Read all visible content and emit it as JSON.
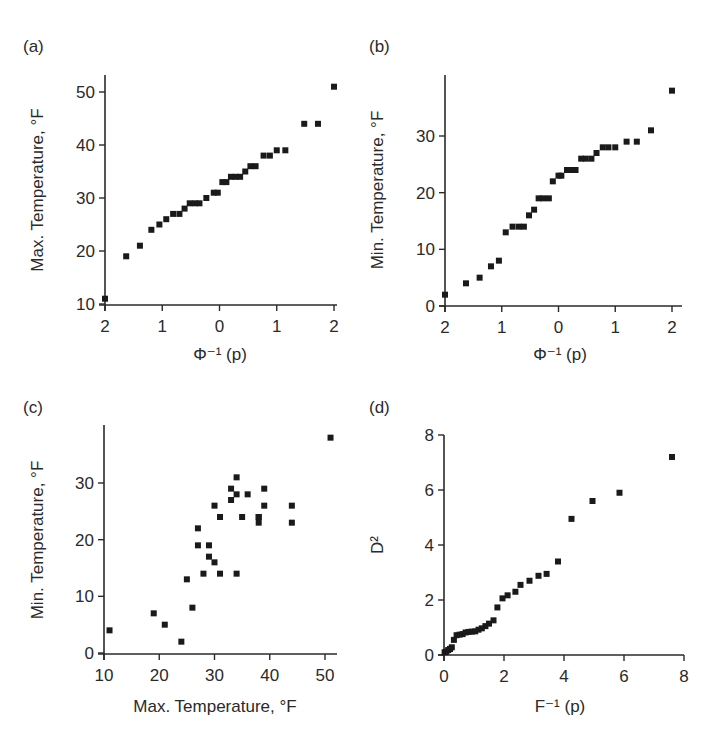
{
  "figure": {
    "panels": [
      {
        "id": "a",
        "label": "(a)"
      },
      {
        "id": "b",
        "label": "(b)"
      },
      {
        "id": "c",
        "label": "(c)"
      },
      {
        "id": "d",
        "label": "(d)"
      }
    ],
    "marker_color": "#1a1a1a",
    "axis_color": "#2a2a2a"
  },
  "chart_data": [
    {
      "panel": "(a)",
      "type": "scatter",
      "title": "",
      "xlabel": "Φ⁻¹ (p)",
      "ylabel": "Max. Temperature, °F",
      "xlim": [
        -2,
        2
      ],
      "ylim": [
        10,
        52
      ],
      "xticks": [
        -2,
        -1,
        0,
        1,
        2
      ],
      "xtick_labels": [
        "2",
        "1",
        "0",
        "1",
        "2"
      ],
      "yticks": [
        10,
        20,
        30,
        40,
        50
      ],
      "ytick_labels": [
        "10",
        "20",
        "30",
        "40",
        "50"
      ],
      "grid": false,
      "x": [
        -2.0,
        -1.63,
        -1.39,
        -1.19,
        -1.05,
        -0.93,
        -0.81,
        -0.7,
        -0.61,
        -0.52,
        -0.43,
        -0.35,
        -0.23,
        -0.1,
        -0.03,
        0.05,
        0.12,
        0.2,
        0.28,
        0.36,
        0.45,
        0.54,
        0.63,
        0.77,
        0.88,
        1.0,
        1.15,
        1.48,
        1.72,
        2.0
      ],
      "y": [
        11,
        19,
        21,
        24,
        25,
        26,
        27,
        27,
        28,
        29,
        29,
        29,
        30,
        31,
        31,
        33,
        33,
        34,
        34,
        34,
        35,
        36,
        36,
        38,
        38,
        39,
        39,
        44,
        44,
        51
      ]
    },
    {
      "panel": "(b)",
      "type": "scatter",
      "title": "",
      "xlabel": "Φ⁻¹ (p)",
      "ylabel": "Min. Temperature, °F",
      "xlim": [
        -2,
        2.2
      ],
      "ylim": [
        0,
        40
      ],
      "xticks": [
        -2,
        -1,
        0,
        1,
        2
      ],
      "xtick_labels": [
        "2",
        "1",
        "0",
        "1",
        "2"
      ],
      "yticks": [
        0,
        10,
        20,
        30
      ],
      "ytick_labels": [
        "0",
        "10",
        "20",
        "30"
      ],
      "grid": false,
      "x": [
        -2.0,
        -1.63,
        -1.39,
        -1.19,
        -1.05,
        -0.93,
        -0.81,
        -0.7,
        -0.61,
        -0.52,
        -0.43,
        -0.35,
        -0.27,
        -0.17,
        -0.1,
        0.0,
        0.05,
        0.15,
        0.22,
        0.3,
        0.4,
        0.48,
        0.58,
        0.67,
        0.78,
        0.88,
        1.0,
        1.2,
        1.38,
        1.63,
        2.0
      ],
      "y": [
        2,
        4,
        5,
        7,
        8,
        13,
        14,
        14,
        14,
        16,
        17,
        19,
        19,
        19,
        22,
        23,
        23,
        24,
        24,
        24,
        26,
        26,
        26,
        27,
        28,
        28,
        28,
        29,
        29,
        31,
        38
      ]
    },
    {
      "panel": "(c)",
      "type": "scatter",
      "title": "",
      "xlabel": "Max. Temperature, °F",
      "ylabel": "Min. Temperature, °F",
      "xlim": [
        10,
        52
      ],
      "ylim": [
        0,
        40
      ],
      "xticks": [
        10,
        20,
        30,
        40,
        50
      ],
      "xtick_labels": [
        "10",
        "20",
        "30",
        "40",
        "50"
      ],
      "yticks": [
        0,
        10,
        20,
        30
      ],
      "ytick_labels": [
        "0",
        "10",
        "20",
        "30"
      ],
      "grid": false,
      "x": [
        11,
        19,
        21,
        24,
        25,
        26,
        27,
        27,
        28,
        29,
        29,
        30,
        30,
        31,
        31,
        33,
        33,
        34,
        34,
        34,
        35,
        36,
        38,
        38,
        38,
        39,
        39,
        44,
        44,
        51
      ],
      "y": [
        4,
        7,
        5,
        2,
        13,
        8,
        22,
        19,
        14,
        19,
        17,
        16,
        26,
        24,
        14,
        29,
        27,
        31,
        28,
        14,
        24,
        28,
        24,
        23,
        24,
        29,
        26,
        26,
        23,
        38
      ]
    },
    {
      "panel": "(d)",
      "type": "scatter",
      "title": "",
      "xlabel": "F⁻¹ (p)",
      "ylabel": "D²",
      "xlim": [
        0,
        8
      ],
      "ylim": [
        0,
        8
      ],
      "xticks": [
        0,
        2,
        4,
        6,
        8
      ],
      "xtick_labels": [
        "0",
        "2",
        "4",
        "6",
        "8"
      ],
      "yticks": [
        0,
        2,
        4,
        6,
        8
      ],
      "ytick_labels": [
        "0",
        "2",
        "4",
        "6",
        "8"
      ],
      "grid": false,
      "x": [
        0.02,
        0.08,
        0.14,
        0.2,
        0.26,
        0.33,
        0.42,
        0.52,
        0.62,
        0.72,
        0.82,
        0.93,
        1.04,
        1.15,
        1.26,
        1.38,
        1.5,
        1.65,
        1.78,
        1.95,
        2.12,
        2.38,
        2.55,
        2.85,
        3.15,
        3.42,
        3.8,
        4.25,
        4.95,
        5.85,
        7.6
      ],
      "y": [
        0.1,
        0.12,
        0.18,
        0.22,
        0.28,
        0.55,
        0.72,
        0.74,
        0.76,
        0.82,
        0.84,
        0.85,
        0.86,
        0.92,
        0.97,
        1.05,
        1.14,
        1.26,
        1.73,
        2.06,
        2.17,
        2.3,
        2.55,
        2.7,
        2.88,
        2.95,
        3.4,
        4.95,
        5.6,
        5.9,
        7.2
      ]
    }
  ]
}
